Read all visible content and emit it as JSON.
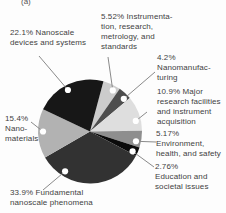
{
  "figure_label": "(a)",
  "chart_data": {
    "type": "pie",
    "title": "",
    "direction": "clockwise",
    "start_angle_deg": 15,
    "unit": "%",
    "legend_position": "callout-labels",
    "grid": false,
    "marker_color": "#ffffff",
    "leader_line_color": "#8a8a8a",
    "slices": [
      {
        "name": "instrumentation-research-metrology-standards",
        "category": "Instrumentation, research, metrology, and standards",
        "value": 5.52,
        "label": "5.52%  Instrumenta-\ntion, research,\nmetrology, and\nstandards",
        "color": "#cccccc"
      },
      {
        "name": "nanomanufacturing",
        "category": "Nanomanufacturing",
        "value": 4.2,
        "label": "4.2%\nNanomanufac-\nturing",
        "color": "#4e4e4e"
      },
      {
        "name": "major-research-facilities-instrument-acquisition",
        "category": "Major research facilities and instrument acquisition",
        "value": 10.9,
        "label": "10.9% Major\nresearch facilities\nand instrument\nacquisition",
        "color": "#dedede"
      },
      {
        "name": "environment-health-safety",
        "category": "Environment, health, and safety",
        "value": 5.17,
        "label": "5.17%\nEnvironment,\nhealth, and safety",
        "color": "#8e8e8e"
      },
      {
        "name": "education-societal-issues",
        "category": "Education and societal issues",
        "value": 2.76,
        "label": "2.76%\nEducation and\nsocietal issues",
        "color": "#0a0a0a"
      },
      {
        "name": "fundamental-nanoscale-phenomena",
        "category": "Fundamental nanoscale phenomena",
        "value": 33.9,
        "label": "33.9% Fundamental\nnanoscale phenomena",
        "color": "#323232"
      },
      {
        "name": "nanomaterials",
        "category": "Nanomaterials",
        "value": 15.4,
        "label": "15.4%\nNano-\nmaterials",
        "color": "#b2b2b2"
      },
      {
        "name": "nanoscale-devices-systems",
        "category": "Nanoscale devices and systems",
        "value": 22.1,
        "label": "22.1% Nanoscale\ndevices and systems",
        "color": "#171717"
      }
    ]
  }
}
